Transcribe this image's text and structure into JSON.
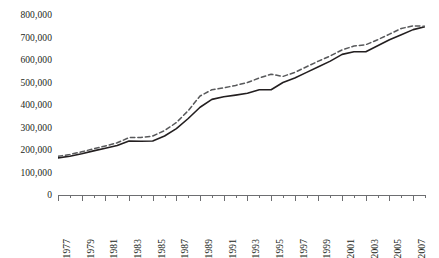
{
  "chart_data": {
    "type": "line",
    "title": "",
    "xlabel": "",
    "ylabel": "",
    "xlim": [
      1977,
      2008
    ],
    "ylim": [
      0,
      800000
    ],
    "grid": false,
    "legend": "none",
    "y_ticks": [
      800000,
      700000,
      600000,
      500000,
      400000,
      300000,
      200000,
      100000,
      0
    ],
    "y_tick_labels": [
      "800,000",
      "700,000",
      "600,000",
      "500,000",
      "400,000",
      "300,000",
      "200,000",
      "100,000",
      "0"
    ],
    "x": [
      1977,
      1978,
      1979,
      1980,
      1981,
      1982,
      1983,
      1984,
      1985,
      1986,
      1987,
      1988,
      1989,
      1990,
      1991,
      1992,
      1993,
      1994,
      1995,
      1996,
      1997,
      1998,
      1999,
      2000,
      2001,
      2002,
      2003,
      2004,
      2005,
      2006,
      2007,
      2008
    ],
    "x_tick_labels": [
      "1977",
      "1979",
      "1981",
      "1983",
      "1985",
      "1987",
      "1989",
      "1991",
      "1993",
      "1995",
      "1997",
      "1999",
      "2001",
      "2003",
      "2005",
      "2007"
    ],
    "x_labeled_years": [
      1977,
      1979,
      1981,
      1983,
      1985,
      1987,
      1989,
      1991,
      1993,
      1995,
      1997,
      1999,
      2001,
      2003,
      2005,
      2007
    ],
    "series": [
      {
        "name": "solid-series",
        "style": "solid",
        "color": "#231f20",
        "values": [
          165000,
          172000,
          183000,
          196000,
          208000,
          220000,
          240000,
          239000,
          240000,
          262000,
          295000,
          340000,
          390000,
          425000,
          437000,
          444000,
          452000,
          468000,
          468000,
          500000,
          520000,
          545000,
          570000,
          595000,
          625000,
          637000,
          637000,
          663000,
          690000,
          712000,
          735000,
          748000
        ]
      },
      {
        "name": "dashed-series",
        "style": "dashed",
        "color": "#58595b",
        "values": [
          172000,
          180000,
          192000,
          205000,
          218000,
          232000,
          255000,
          256000,
          262000,
          286000,
          322000,
          375000,
          440000,
          468000,
          476000,
          487000,
          500000,
          520000,
          537000,
          527000,
          545000,
          570000,
          595000,
          618000,
          645000,
          662000,
          668000,
          690000,
          715000,
          740000,
          752000,
          750000
        ]
      }
    ]
  }
}
